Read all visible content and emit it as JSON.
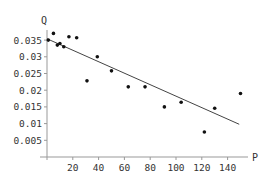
{
  "chart_data": {
    "type": "scatter",
    "title": "",
    "xlabel": "P",
    "ylabel": "Q",
    "xlim": [
      0,
      155
    ],
    "ylim": [
      0,
      0.037
    ],
    "grid": false,
    "legend": null,
    "x_ticks": [
      20,
      40,
      60,
      80,
      100,
      120,
      140
    ],
    "x_tick_labels": [
      "20",
      "40",
      "60",
      "80",
      "100",
      "120",
      "140"
    ],
    "y_ticks": [
      0.005,
      0.01,
      0.015,
      0.02,
      0.025,
      0.03,
      0.035
    ],
    "y_tick_labels": [
      "0.005",
      "0.01",
      "0.015",
      "0.02",
      "0.025",
      "0.03",
      "0.035"
    ],
    "series": [
      {
        "name": "observations",
        "kind": "scatter",
        "x": [
          1,
          5,
          8,
          10,
          13,
          17,
          23,
          31,
          39,
          50,
          63,
          76,
          91,
          104,
          122,
          130,
          150
        ],
        "y": [
          0.035,
          0.037,
          0.0335,
          0.034,
          0.033,
          0.036,
          0.0357,
          0.0228,
          0.03,
          0.0258,
          0.021,
          0.021,
          0.015,
          0.0164,
          0.0075,
          0.0146,
          0.019
        ]
      },
      {
        "name": "linear fit",
        "kind": "line",
        "x": [
          0,
          149
        ],
        "y": [
          0.0354,
          0.0098
        ]
      }
    ]
  },
  "colors": {
    "points": "#111111",
    "fit_line": "#444444",
    "axes": "#999999",
    "text": "#333333"
  }
}
